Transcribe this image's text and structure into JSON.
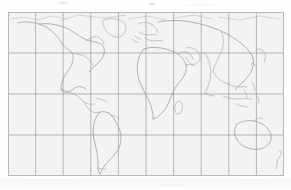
{
  "document": {
    "kind": "scanned-figure",
    "page_background": "#fefefe",
    "has_top_scan_artifact": true,
    "has_bottom_scan_artifact": true
  },
  "figure": {
    "name": "world-map",
    "caption": "",
    "frame": {
      "x": 8,
      "y": 12,
      "width": 276,
      "height": 164,
      "background_color": "#f4f4f2",
      "border_color": "#b9b9b9"
    }
  },
  "chart_data": {
    "type": "map",
    "title": "",
    "subtitle": "",
    "projection": "equirectangular",
    "xlabel": "Longitude",
    "ylabel": "Latitude",
    "xlim": [
      -180,
      180
    ],
    "ylim": [
      -60,
      84
    ],
    "grid": true,
    "grid_color": "#8d8d8d",
    "graticule": {
      "meridian_spacing_deg": 36,
      "parallel_spacing_deg": 36,
      "meridians": [
        -180,
        -144,
        -108,
        -72,
        -36,
        0,
        36,
        72,
        108,
        144,
        180
      ],
      "parallels": [
        -60,
        -24,
        12,
        48,
        84
      ],
      "columns": 10,
      "rows": 4
    },
    "coastline_color": "#a9a9a9",
    "land_fill": "none",
    "legend": null,
    "annotations": [],
    "landmasses": [
      "North America",
      "South America",
      "Greenland",
      "Europe",
      "Africa",
      "Asia",
      "Australia",
      "New Zealand",
      "Madagascar",
      "Japan",
      "Indonesia",
      "Philippines",
      "British Isles"
    ]
  }
}
